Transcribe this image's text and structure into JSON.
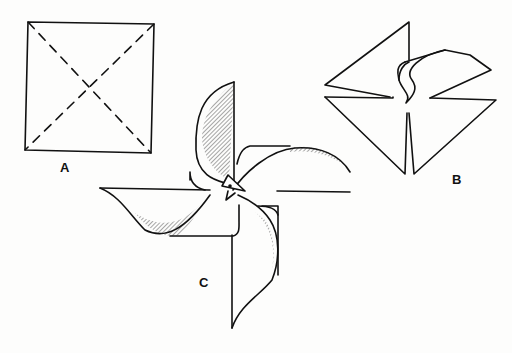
{
  "figure": {
    "panels": [
      {
        "id": "A",
        "label": "A",
        "description": "Square sheet with dashed diagonal fold lines"
      },
      {
        "id": "B",
        "label": "B",
        "description": "Cut diagonals with one corner curled toward center"
      },
      {
        "id": "C",
        "label": "C",
        "description": "Finished pinwheel with four curled blades and bird-head center"
      }
    ]
  },
  "colors": {
    "line": "#111111",
    "background": "#fdfdfc"
  }
}
